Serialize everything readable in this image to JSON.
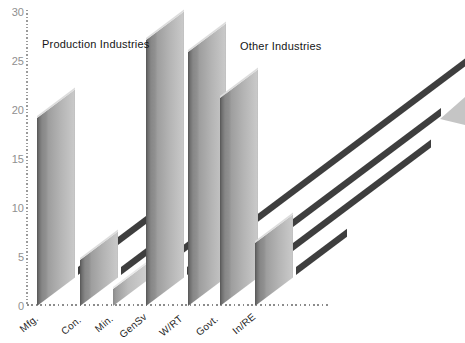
{
  "chart_data": {
    "type": "bar",
    "title": "",
    "categories": [
      "Mfg.",
      "Con.",
      "Min.",
      "GenSv",
      "W/RT",
      "Govt.",
      "In/RE"
    ],
    "values": [
      19.4,
      4.9,
      1.9,
      27.3,
      26.1,
      21.4,
      6.6
    ],
    "xlabel": "",
    "ylabel": "",
    "ylim": [
      0,
      30
    ],
    "y_ticks": [
      0,
      5,
      10,
      15,
      20,
      25,
      30
    ],
    "grid": "dotted-axes-only",
    "legend": "none",
    "style": "3d-oblique-slab-bars-with-cast-shadow-stripes",
    "annotations": [
      {
        "text": "Production Industries",
        "group": "left"
      },
      {
        "text": "Other Industries",
        "group": "right"
      },
      {
        "type": "arrowhead",
        "note": "gray arrowhead entering from right edge pointing down-left",
        "color": "#c5c5c5"
      }
    ],
    "colors": {
      "bar_face_dark": "#565656",
      "bar_face_light": "#c8c8c8",
      "bar_top_highlight": "#dcdcdc",
      "shadow_stripe": "#3e3e3e",
      "axis_dots": "#9a9a9a",
      "tick_label": "#8f8f8f",
      "category_label": "#1f1f1f",
      "background": "#ffffff"
    },
    "layout": {
      "base_y": 306,
      "px_per_unit": 9.8,
      "bar_width": 38,
      "depth_dx": 41,
      "depth_slope": 0.75,
      "bar_x": [
        37,
        80,
        113,
        146,
        188,
        220,
        255
      ],
      "light_bar_index": 2,
      "shadow_end_x": [
        152,
        152,
        191,
        466,
        441,
        431,
        347
      ],
      "xlabel_centers": [
        [
          29,
          325
        ],
        [
          71,
          327
        ],
        [
          104,
          325
        ],
        [
          133,
          327
        ],
        [
          171,
          327
        ],
        [
          207,
          327
        ],
        [
          244,
          325
        ]
      ],
      "title_left_pos": [
        42,
        38
      ],
      "title_right_pos": [
        240,
        40
      ]
    }
  }
}
